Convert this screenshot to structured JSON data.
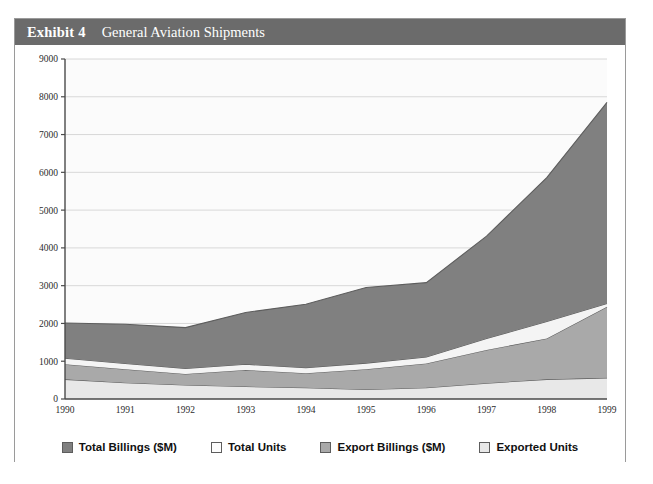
{
  "header": {
    "exhibit_label": "Exhibit 4",
    "title": "General Aviation Shipments"
  },
  "colors": {
    "header_bg": "#6b6b6b",
    "header_text": "#ffffff",
    "frame_border": "#9a9a9a",
    "plot_bg": "#fbfbfb",
    "gridline": "#d8d8d8",
    "axis": "#4a4a4a",
    "total_billings": "#808080",
    "total_units": "#f4f4f4",
    "export_billings": "#a9a9a9",
    "exported_units": "#e8e8e8",
    "series_outline": "#5d5d5d"
  },
  "chart_data": {
    "type": "area",
    "stacked": true,
    "title": "General Aviation Shipments",
    "xlabel": "",
    "ylabel": "",
    "grid": true,
    "legend_position": "bottom",
    "ylim": [
      0,
      9000
    ],
    "yticks": [
      0,
      1000,
      2000,
      3000,
      4000,
      5000,
      6000,
      7000,
      8000,
      9000
    ],
    "categories": [
      "1990",
      "1991",
      "1992",
      "1993",
      "1994",
      "1995",
      "1996",
      "1997",
      "1998",
      "1999"
    ],
    "series": [
      {
        "name": "Exported Units",
        "color": "#e8e8e8",
        "values": [
          520,
          430,
          370,
          330,
          300,
          250,
          300,
          420,
          520,
          560
        ]
      },
      {
        "name": "Export Billings ($M)",
        "color": "#a9a9a9",
        "values": [
          400,
          360,
          290,
          440,
          380,
          540,
          640,
          880,
          1080,
          1880
        ]
      },
      {
        "name": "Total Units",
        "color": "#f4f4f4",
        "values": [
          160,
          150,
          150,
          150,
          150,
          160,
          170,
          300,
          450,
          90
        ]
      },
      {
        "name": "Total Billings ($M)",
        "color": "#808080",
        "values": [
          930,
          1040,
          1080,
          1370,
          1680,
          2000,
          1970,
          2710,
          3810,
          5320
        ]
      }
    ],
    "cumulative_tops": {
      "exported_units": [
        520,
        430,
        370,
        330,
        300,
        250,
        300,
        420,
        520,
        560
      ],
      "export_billings": [
        920,
        790,
        660,
        770,
        680,
        790,
        940,
        1300,
        1600,
        2440
      ],
      "total_units": [
        1080,
        940,
        810,
        920,
        830,
        950,
        1110,
        1600,
        2050,
        2530
      ],
      "total_billings": [
        2010,
        1980,
        1890,
        2290,
        2510,
        2950,
        3080,
        4310,
        5860,
        7850
      ]
    }
  },
  "legend": {
    "items": [
      {
        "label": "Total Billings ($M)",
        "swatch": "#808080"
      },
      {
        "label": "Total Units",
        "swatch": "#fdfdfd"
      },
      {
        "label": "Export Billings ($M)",
        "swatch": "#a9a9a9"
      },
      {
        "label": "Exported Units",
        "swatch": "#e8e8e8"
      }
    ]
  }
}
